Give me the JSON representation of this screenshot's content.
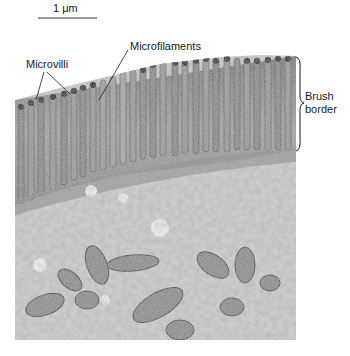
{
  "figure": {
    "type": "electron micrograph",
    "scale_bar": {
      "label": "1 μm"
    },
    "labels": {
      "microvilli": "Microvilli",
      "microfilaments": "Microfilaments",
      "brush_border_line1": "Brush",
      "brush_border_line2": "border"
    },
    "colors": {
      "background": "#ffffff",
      "micrograph_light": "#d9d9d9",
      "micrograph_mid": "#a8a8a8",
      "micrograph_dark": "#4a4a4a",
      "ink": "#1a1a1a"
    }
  }
}
